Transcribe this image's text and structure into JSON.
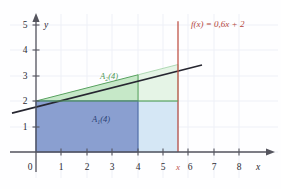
{
  "figure": {
    "title_label": "f(x) = 0,6x + 2",
    "background_color": "#fefeff",
    "grid_color": "#eef0f7",
    "axis_color": "#55555e"
  },
  "axes": {
    "x": {
      "name": "x",
      "ticks": [
        "0",
        "1",
        "2",
        "3",
        "4",
        "5",
        "6",
        "7",
        "8"
      ],
      "tick_values": [
        0,
        1,
        2,
        3,
        4,
        5,
        6,
        7,
        8
      ],
      "range": [
        -0.45,
        9.2
      ]
    },
    "y": {
      "name": "y",
      "ticks": [
        "1",
        "2",
        "3",
        "4",
        "5"
      ],
      "tick_values": [
        1,
        2,
        3,
        4,
        5
      ],
      "range": [
        -0.6,
        5.6
      ]
    }
  },
  "function": {
    "label": "f(x) = 0,6x + 2",
    "slope": 0.6,
    "intercept": 2,
    "line_color": "#262630",
    "label_color": "#b5463c"
  },
  "marker": {
    "label": "x",
    "x_value": 5.6,
    "color": "#c0554a"
  },
  "regions": [
    {
      "name": "A2(4)",
      "label_main": "A",
      "label_sub": "2",
      "label_tail": "(4)",
      "fill": "#c6e8c8",
      "stroke": "#4f9a57",
      "text_color": "#4f9a57",
      "x_from": 0,
      "x_to": 4,
      "y_from": 2,
      "shape": "trapezoid-under-line"
    },
    {
      "name": "A1(4)",
      "label_main": "A",
      "label_sub": "1",
      "label_tail": "(4)",
      "fill": "#8a9fd0",
      "stroke": "#3c5899",
      "text_color": "#2a3f74",
      "x_from": 0,
      "x_to": 4,
      "y_from": 0,
      "y_to": 2,
      "shape": "rectangle"
    },
    {
      "name": "extension-light",
      "label_main": "",
      "label_sub": "",
      "label_tail": "",
      "fill": "#d5e7f5",
      "stroke": "#9fc3df",
      "text_color": "#9fc3df",
      "x_from": 4,
      "x_to": 5.6,
      "y_from": 0,
      "y_to": 2,
      "shape": "rectangle"
    },
    {
      "name": "extension-green-strip",
      "label_main": "",
      "label_sub": "",
      "label_tail": "",
      "fill": "#e5f4e6",
      "stroke": "#7fbd86",
      "text_color": "#7fbd86",
      "x_from": 4,
      "x_to": 5.6,
      "y_from": 2,
      "shape": "trapezoid-under-line"
    }
  ]
}
